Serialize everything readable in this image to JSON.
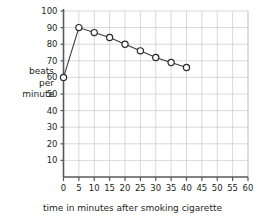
{
  "chart_data": {
    "type": "line",
    "title": "",
    "xlabel": "time in minutes after smoking cigarette",
    "ylabel": "beats per minute",
    "ylabel_lines": [
      "beats",
      "per",
      "minute"
    ],
    "x": [
      0,
      5,
      10,
      15,
      20,
      25,
      30,
      35,
      40
    ],
    "values": [
      60,
      90,
      87,
      84,
      80,
      76,
      72,
      69,
      66
    ],
    "series": [
      {
        "name": "heart rate",
        "values": [
          60,
          90,
          87,
          84,
          80,
          76,
          72,
          69,
          66
        ]
      }
    ],
    "xlim": [
      0,
      60
    ],
    "ylim": [
      0,
      100
    ],
    "xticks": [
      0,
      5,
      10,
      15,
      20,
      25,
      30,
      35,
      40,
      45,
      50,
      55,
      60
    ],
    "yticks": [
      10,
      20,
      30,
      40,
      50,
      60,
      70,
      80,
      90,
      100
    ],
    "xtick_labels": [
      "0",
      "5",
      "10",
      "15",
      "20",
      "25",
      "30",
      "35",
      "40",
      "45",
      "50",
      "55",
      "60"
    ],
    "ytick_labels": [
      "10",
      "20",
      "30",
      "40",
      "50",
      "60",
      "70",
      "80",
      "90",
      "100"
    ],
    "grid": true,
    "legend": "none",
    "marker": "open-circle",
    "line_color": "#2b2b2b",
    "grid_color": "#c9c9c9",
    "axis_color": "#58595b"
  }
}
